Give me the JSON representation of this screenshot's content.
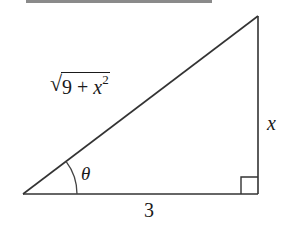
{
  "diagram": {
    "type": "right-triangle",
    "top_bar": {
      "color": "#8a8a8a"
    },
    "stroke_color": "#333333",
    "vertices": {
      "angle_vertex": [
        23,
        194
      ],
      "right_angle_vertex": [
        258,
        194
      ],
      "top_vertex": [
        258,
        16
      ]
    },
    "labels": {
      "hypotenuse": {
        "radical": "√",
        "constant": "9 + ",
        "variable": "x",
        "exponent": "2"
      },
      "opposite": "x",
      "adjacent": "3",
      "angle": "θ"
    },
    "right_angle_marker": {
      "size": 17
    },
    "angle_arc": {
      "radius": 54
    }
  }
}
